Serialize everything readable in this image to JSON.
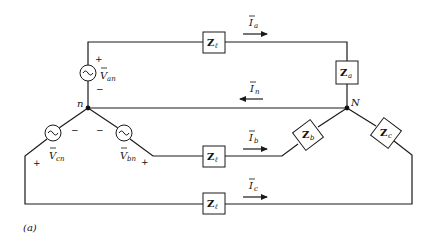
{
  "figure": {
    "caption": "(a)",
    "stroke_color": "#1a1a1a",
    "background": "#ffffff"
  },
  "nodes": {
    "source_neutral": "n",
    "load_neutral": "N"
  },
  "sources": [
    {
      "id": "van",
      "symbol": "V",
      "subscript": "an",
      "plus": "+",
      "minus": "−"
    },
    {
      "id": "vbn",
      "symbol": "V",
      "subscript": "bn",
      "plus": "+",
      "minus": "−"
    },
    {
      "id": "vcn",
      "symbol": "V",
      "subscript": "cn",
      "plus": "+",
      "minus": "−"
    }
  ],
  "line_impedances": [
    {
      "id": "zl-a",
      "symbol": "Z",
      "subscript": "ℓ"
    },
    {
      "id": "zl-b",
      "symbol": "Z",
      "subscript": "ℓ"
    },
    {
      "id": "zl-c",
      "symbol": "Z",
      "subscript": "ℓ"
    }
  ],
  "load_impedances": [
    {
      "id": "za",
      "symbol": "Z",
      "subscript": "a"
    },
    {
      "id": "zb",
      "symbol": "Z",
      "subscript": "b"
    },
    {
      "id": "zc",
      "symbol": "Z",
      "subscript": "c"
    }
  ],
  "currents": [
    {
      "id": "ia",
      "symbol": "I",
      "subscript": "a",
      "direction": "right"
    },
    {
      "id": "in",
      "symbol": "I",
      "subscript": "n",
      "direction": "left"
    },
    {
      "id": "ib",
      "symbol": "I",
      "subscript": "b",
      "direction": "right"
    },
    {
      "id": "ic",
      "symbol": "I",
      "subscript": "c",
      "direction": "right"
    }
  ]
}
